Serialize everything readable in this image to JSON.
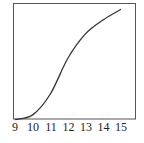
{
  "chart_data": {
    "type": "line",
    "title": "",
    "xlabel": "",
    "ylabel": "",
    "x": [
      9,
      10,
      11,
      12,
      13,
      14,
      15
    ],
    "series": [
      {
        "name": "curve",
        "values": [
          0.0,
          0.04,
          0.22,
          0.53,
          0.74,
          0.86,
          0.95
        ]
      }
    ],
    "xlim": [
      9,
      15
    ],
    "ylim": [
      0,
      1
    ],
    "x_ticks": [
      "9",
      "10",
      "11",
      "12",
      "13",
      "14",
      "15"
    ],
    "y_ticks": [],
    "grid": false,
    "legend": "none",
    "colors": {
      "line": "#333333",
      "frame": "#444444"
    }
  }
}
